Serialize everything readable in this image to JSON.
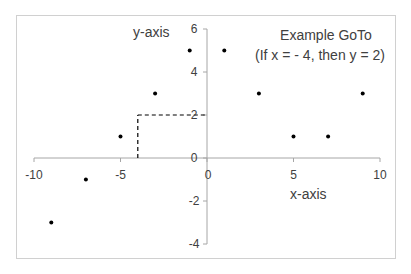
{
  "chart_data": {
    "type": "scatter",
    "title": "",
    "annotation": {
      "line1": "Example GoTo",
      "line2": "(If x = - 4, then y = 2)"
    },
    "xlabel": "x-axis",
    "ylabel": "y-axis",
    "xlim": [
      -10,
      10
    ],
    "ylim": [
      -4,
      6
    ],
    "x_ticks": [
      -10,
      -5,
      0,
      5,
      10
    ],
    "y_ticks": [
      -4,
      -2,
      0,
      2,
      4,
      6
    ],
    "x_tick_labels": [
      "-10",
      "-5",
      "0",
      "5",
      "10"
    ],
    "y_tick_labels": [
      "-4",
      "-2",
      "0",
      "2",
      "4",
      "6"
    ],
    "grid": false,
    "legend": null,
    "series": [
      {
        "name": "points",
        "x": [
          -9,
          -7,
          -5,
          -3,
          -1,
          1,
          3,
          5,
          7,
          9
        ],
        "y": [
          -3,
          -1,
          1,
          3,
          5,
          5,
          3,
          1,
          1,
          3
        ],
        "marker": "circle",
        "color": "#000000"
      }
    ],
    "guide": {
      "x": -4,
      "y": 2,
      "style": "dashed"
    }
  },
  "colors": {
    "axis": "#a6a6a6",
    "border": "#d0d0d0",
    "text": "#404040",
    "point": "#000000",
    "guide": "#000000"
  }
}
